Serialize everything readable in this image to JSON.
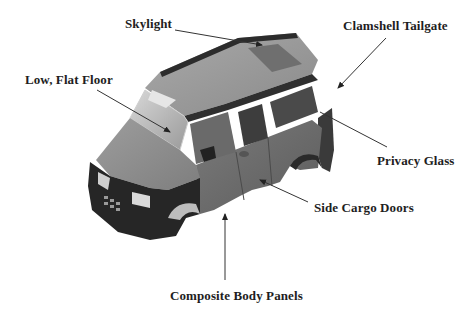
{
  "diagram": {
    "colors": {
      "body": "#8c8c8c",
      "body_dark": "#2a2a2a",
      "glass": "#b8b8b8",
      "leader_line": "#333333",
      "label_text": "#1e1e1e"
    },
    "labels": [
      {
        "id": "skylight",
        "text": "Skylight"
      },
      {
        "id": "clamshell-tailgate",
        "text": "Clamshell Tailgate"
      },
      {
        "id": "low-flat-floor",
        "text": "Low, Flat Floor"
      },
      {
        "id": "privacy-glass",
        "text": "Privacy Glass"
      },
      {
        "id": "side-cargo-doors",
        "text": "Side Cargo Doors"
      },
      {
        "id": "composite-body-panels",
        "text": "Composite Body Panels"
      }
    ]
  }
}
